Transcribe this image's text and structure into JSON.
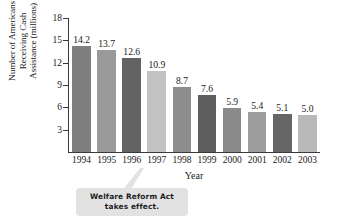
{
  "chart_data": {
    "type": "bar",
    "title": "",
    "xlabel": "Year",
    "ylabel": "Number of Americans Receiving Cash Assistance (millions)",
    "categories": [
      "1994",
      "1995",
      "1996",
      "1997",
      "1998",
      "1999",
      "2000",
      "2001",
      "2002",
      "2003"
    ],
    "values": [
      14.2,
      13.7,
      12.6,
      10.9,
      8.7,
      7.6,
      5.9,
      5.4,
      5.1,
      5.0
    ],
    "value_labels": [
      "14.2",
      "13.7",
      "12.6",
      "10.9",
      "8.7",
      "7.6",
      "5.9",
      "5.4",
      "5.1",
      "5.0"
    ],
    "bar_colors": [
      "#7f7f7f",
      "#9a9a9a",
      "#636363",
      "#c2c2c2",
      "#8d8d8d",
      "#5e5e5e",
      "#8a8a8a",
      "#9e9e9e",
      "#666666",
      "#b9b9b9"
    ],
    "ylim": [
      0,
      18
    ],
    "y_ticks": [
      3,
      6,
      9,
      12,
      15,
      18
    ],
    "y_tick_labels": [
      "3",
      "6",
      "9",
      "12",
      "15",
      "18"
    ],
    "grid": false,
    "legend": "none"
  },
  "y_axis_title_lines": [
    "Number of Americans",
    "Receiving Cash",
    "Assistance (millions)"
  ],
  "annotation": {
    "line1": "Welfare Reform Act",
    "line2": "takes effect.",
    "points_to": "1997"
  }
}
